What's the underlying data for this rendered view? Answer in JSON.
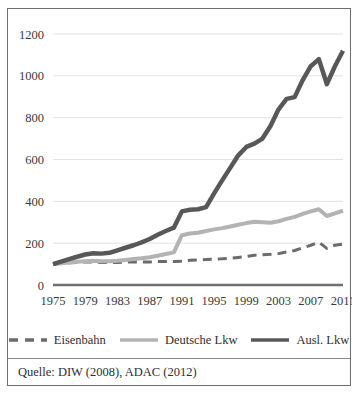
{
  "figure": {
    "source_note": "Quelle: DIW (2008), ADAC (2012)",
    "border_color": "#6e6e6e",
    "background": "#ffffff"
  },
  "legend": {
    "position": "bottom",
    "entries": [
      {
        "label": "Eisenbahn",
        "color": "#6b6b6b",
        "style": "dashed",
        "swatch_name": "legend-swatch-eisenbahn"
      },
      {
        "label": "Deutsche Lkw",
        "color": "#b3b3b3",
        "style": "solid",
        "swatch_name": "legend-swatch-deutsche-lkw"
      },
      {
        "label": "Ausl. Lkw",
        "color": "#585858",
        "style": "solid",
        "swatch_name": "legend-swatch-ausl-lkw"
      }
    ]
  },
  "chart_data": {
    "type": "line",
    "title": "",
    "subtitle": "",
    "xlabel": "",
    "ylabel": "",
    "xlim": [
      1975,
      2011
    ],
    "ylim": [
      0,
      1200
    ],
    "ytick_step": 200,
    "yticks": [
      0,
      200,
      400,
      600,
      800,
      1000,
      1200
    ],
    "ytick_labels": [
      "0",
      "200",
      "400",
      "600",
      "800",
      "1000",
      "1200"
    ],
    "xticks": [
      1975,
      1979,
      1983,
      1987,
      1991,
      1995,
      1999,
      2003,
      2007,
      2011
    ],
    "xtick_labels": [
      "1975",
      "1979",
      "1983",
      "1987",
      "1991",
      "1995",
      "1999",
      "2003",
      "2007",
      "2011"
    ],
    "grid": "horizontal",
    "grid_color": "#e2e2e2",
    "axis_color": "#6e6e6e",
    "index_base": "1975 = 100",
    "x": [
      1975,
      1976,
      1977,
      1978,
      1979,
      1980,
      1981,
      1982,
      1983,
      1984,
      1985,
      1986,
      1987,
      1988,
      1989,
      1990,
      1991,
      1992,
      1993,
      1994,
      1995,
      1996,
      1997,
      1998,
      1999,
      2000,
      2001,
      2002,
      2003,
      2004,
      2005,
      2006,
      2007,
      2008,
      2009,
      2010,
      2011
    ],
    "series": [
      {
        "name": "Eisenbahn",
        "color": "#6b6b6b",
        "style": "dashed",
        "width": 3,
        "values": [
          100,
          104,
          106,
          108,
          110,
          110,
          108,
          107,
          108,
          110,
          110,
          110,
          110,
          112,
          112,
          112,
          113,
          118,
          120,
          122,
          124,
          125,
          128,
          132,
          136,
          142,
          145,
          147,
          150,
          158,
          165,
          178,
          190,
          205,
          175,
          190,
          196
        ]
      },
      {
        "name": "Deutsche Lkw",
        "color": "#b3b3b3",
        "style": "solid",
        "width": 4,
        "values": [
          100,
          104,
          108,
          111,
          114,
          116,
          114,
          113,
          116,
          120,
          124,
          128,
          133,
          140,
          148,
          156,
          238,
          246,
          250,
          258,
          266,
          272,
          280,
          288,
          296,
          302,
          300,
          298,
          305,
          316,
          326,
          340,
          352,
          362,
          330,
          342,
          355
        ]
      },
      {
        "name": "Ausl. Lkw",
        "color": "#585858",
        "style": "solid",
        "width": 4.5,
        "values": [
          100,
          112,
          124,
          135,
          146,
          152,
          150,
          154,
          166,
          178,
          190,
          204,
          220,
          240,
          258,
          274,
          352,
          360,
          362,
          372,
          438,
          500,
          560,
          620,
          660,
          676,
          700,
          760,
          840,
          890,
          898,
          980,
          1046,
          1080,
          960,
          1046,
          1120
        ]
      }
    ]
  }
}
